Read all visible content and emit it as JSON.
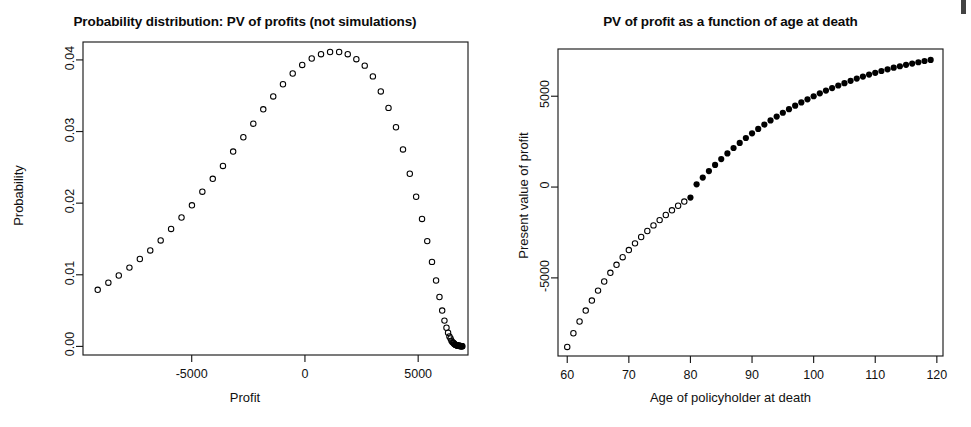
{
  "figure": {
    "background": "#ffffff",
    "foreground": "#000000",
    "artifact_note": "scan-edge-mark"
  },
  "panels": [
    {
      "id": "left",
      "title": "Probability distribution: PV of profits (not simulations)",
      "xlabel": "Profit",
      "ylabel": "Probability"
    },
    {
      "id": "right",
      "title": "PV of profit as a function of age at death",
      "xlabel": "Age of policyholder at death",
      "ylabel": "Present value of profit"
    }
  ],
  "chart_data": [
    {
      "type": "scatter",
      "id": "probability-distribution-pv-of-profits",
      "title": "Probability distribution: PV of profits (not simulations)",
      "xlabel": "Profit",
      "ylabel": "Probability",
      "xlim": [
        -9800,
        7200
      ],
      "ylim": [
        -0.0012,
        0.0425
      ],
      "xticks": [
        -5000,
        0,
        5000
      ],
      "xtick_labels": [
        "-5000",
        "0",
        "5000"
      ],
      "yticks": [
        0.0,
        0.01,
        0.02,
        0.03,
        0.04
      ],
      "ytick_labels": [
        "0.00",
        "0.01",
        "0.02",
        "0.03",
        "0.04"
      ],
      "grid": false,
      "legend": false,
      "marker": "open-circle",
      "marker_color": "#000000",
      "marker_fill": "none",
      "x": [
        -9150,
        -8680,
        -8220,
        -7750,
        -7290,
        -6830,
        -6370,
        -5910,
        -5450,
        -4990,
        -4530,
        -4070,
        -3620,
        -3170,
        -2720,
        -2280,
        -1840,
        -1400,
        -970,
        -540,
        -120,
        300,
        710,
        1110,
        1510,
        1890,
        2270,
        2640,
        3000,
        3350,
        3690,
        4020,
        4330,
        4630,
        4910,
        5170,
        5400,
        5610,
        5790,
        5940,
        6060,
        6160,
        6250,
        6320,
        6380,
        6430,
        6470,
        6510,
        6550,
        6580,
        6610,
        6640,
        6660,
        6680,
        6700,
        6720,
        6740,
        6760,
        6780,
        6800,
        6815,
        6830,
        6845,
        6860,
        6875,
        6890,
        6905,
        6920,
        6935,
        6950
      ],
      "y": [
        0.0079,
        0.0089,
        0.0099,
        0.011,
        0.0122,
        0.0134,
        0.0148,
        0.0164,
        0.018,
        0.0197,
        0.0216,
        0.0234,
        0.0252,
        0.0272,
        0.0292,
        0.0311,
        0.0331,
        0.0349,
        0.0366,
        0.0381,
        0.0393,
        0.0402,
        0.0408,
        0.0411,
        0.0411,
        0.0408,
        0.0401,
        0.0392,
        0.0377,
        0.0356,
        0.0333,
        0.0306,
        0.0275,
        0.0241,
        0.0209,
        0.0178,
        0.0147,
        0.0118,
        0.0092,
        0.0069,
        0.005,
        0.0036,
        0.0026,
        0.0019,
        0.0014,
        0.0011,
        0.0008,
        0.0006,
        0.0005,
        0.0004,
        0.0003,
        0.00025,
        0.0002,
        0.00018,
        0.00015,
        0.00013,
        0.00011,
        0.0001,
        9e-05,
        8e-05,
        7e-05,
        6e-05,
        6e-05,
        5e-05,
        5e-05,
        4e-05,
        4e-05,
        3e-05,
        3e-05,
        2e-05
      ]
    },
    {
      "type": "scatter",
      "id": "pv-of-profit-vs-age-at-death",
      "title": "PV of profit as a function of age at death",
      "xlabel": "Age of policyholder at death",
      "ylabel": "Present value of profit",
      "xlim": [
        58.5,
        121.0
      ],
      "ylim": [
        -9300,
        7600
      ],
      "xticks": [
        60,
        70,
        80,
        90,
        100,
        110,
        120
      ],
      "xtick_labels": [
        "60",
        "70",
        "80",
        "90",
        "100",
        "110",
        "120"
      ],
      "yticks": [
        -5000,
        0,
        5000
      ],
      "ytick_labels": [
        "-5000",
        "0",
        "5000"
      ],
      "grid": false,
      "legend": false,
      "marker_open": "open-circle",
      "marker_filled": "filled-circle",
      "marker_color": "#000000",
      "fill_threshold_x": 80,
      "x": [
        60,
        61,
        62,
        63,
        64,
        65,
        66,
        67,
        68,
        69,
        70,
        71,
        72,
        73,
        74,
        75,
        76,
        77,
        78,
        79,
        80,
        81,
        82,
        83,
        84,
        85,
        86,
        87,
        88,
        89,
        90,
        91,
        92,
        93,
        94,
        95,
        96,
        97,
        98,
        99,
        100,
        101,
        102,
        103,
        104,
        105,
        106,
        107,
        108,
        109,
        110,
        111,
        112,
        113,
        114,
        115,
        116,
        117,
        118,
        119
      ],
      "y": [
        -8800,
        -8050,
        -7400,
        -6800,
        -6250,
        -5700,
        -5200,
        -4720,
        -4280,
        -3860,
        -3470,
        -3100,
        -2750,
        -2420,
        -2110,
        -1820,
        -1540,
        -1280,
        -1030,
        -800,
        -580,
        150,
        520,
        880,
        1220,
        1540,
        1850,
        2150,
        2430,
        2700,
        2960,
        3200,
        3440,
        3670,
        3880,
        4090,
        4290,
        4480,
        4660,
        4830,
        5000,
        5160,
        5310,
        5450,
        5590,
        5720,
        5850,
        5970,
        6080,
        6190,
        6290,
        6390,
        6480,
        6570,
        6650,
        6730,
        6800,
        6870,
        6940,
        7000
      ]
    }
  ]
}
